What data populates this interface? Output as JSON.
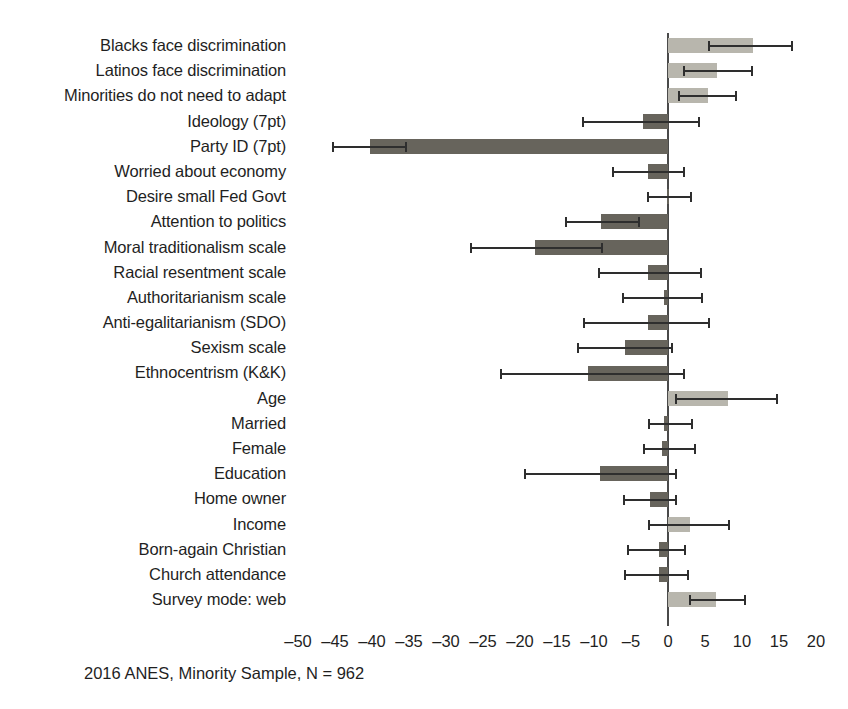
{
  "caption": "2016 ANES, Minority Sample, N = 962",
  "colors": {
    "positive_bar": "#b8b6ad",
    "negative_bar": "#67645c",
    "error_bar": "#2e2e2e",
    "axis": "#4a4a4a",
    "text": "#1f1f1f",
    "background": "#ffffff"
  },
  "chart_data": {
    "type": "bar",
    "orientation": "horizontal",
    "title": "",
    "subtitle": "",
    "xlabel": "",
    "ylabel": "",
    "xlim": [
      -52,
      22
    ],
    "xticks": [
      -50,
      -45,
      -40,
      -35,
      -30,
      -25,
      -20,
      -15,
      -10,
      -5,
      0,
      5,
      10,
      15,
      20
    ],
    "xtick_labels": [
      "–50",
      "–45",
      "–40",
      "–35",
      "–30",
      "–25",
      "–20",
      "–15",
      "–10",
      "–5",
      "0",
      "5",
      "10",
      "15",
      "20"
    ],
    "grid": false,
    "legend": "none",
    "error_bars": "confidence interval",
    "categories": [
      "Blacks face discrimination",
      "Latinos face discrimination",
      "Minorities do not need to adapt",
      "Ideology (7pt)",
      "Party ID (7pt)",
      "Worried about economy",
      "Desire small Fed Govt",
      "Attention to politics",
      "Moral traditionalism scale",
      "Racial resentment scale",
      "Authoritarianism scale",
      "Anti-egalitarianism (SDO)",
      "Sexism scale",
      "Ethnocentrism (K&K)",
      "Age",
      "Married",
      "Female",
      "Education",
      "Home owner",
      "Income",
      "Born-again Christian",
      "Church attendance",
      "Survey mode: web"
    ],
    "values": [
      11.5,
      6.6,
      5.4,
      -3.4,
      -40.3,
      -2.7,
      -0.2,
      -9.1,
      -18.0,
      -2.7,
      -0.5,
      -2.7,
      -5.8,
      -10.8,
      8.1,
      -0.5,
      -0.8,
      -9.2,
      -2.4,
      3.0,
      -1.2,
      -1.2,
      6.5
    ],
    "ci_low": [
      5.4,
      2.0,
      1.4,
      -11.6,
      -45.4,
      -7.6,
      -2.8,
      -13.9,
      -26.8,
      -9.5,
      -6.2,
      -11.5,
      -12.3,
      -22.7,
      0.9,
      -2.7,
      -3.4,
      -19.5,
      -6.1,
      -2.7,
      -5.5,
      -6.0,
      2.8
    ],
    "ci_high": [
      16.9,
      11.5,
      9.3,
      4.3,
      -35.3,
      2.3,
      3.2,
      -3.8,
      -8.8,
      4.6,
      4.7,
      5.7,
      0.7,
      2.3,
      14.9,
      3.4,
      3.8,
      1.2,
      1.2,
      8.4,
      2.5,
      2.9,
      10.5
    ]
  }
}
